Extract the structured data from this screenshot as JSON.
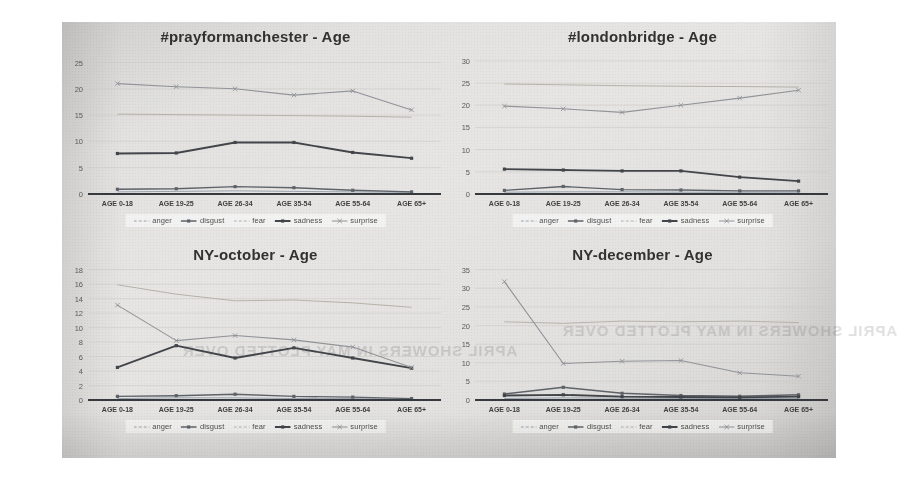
{
  "figure": {
    "categories": [
      "AGE 0-18",
      "AGE 19-25",
      "AGE 26-34",
      "AGE 35-54",
      "AGE 55-64",
      "AGE 65+"
    ],
    "legend": [
      {
        "name": "anger",
        "color": "#9aa4b0",
        "marker": "none",
        "width": 1
      },
      {
        "name": "disgust",
        "color": "#5a5f66",
        "marker": "dot",
        "width": 1.4
      },
      {
        "name": "fear",
        "color": "#b7b2a8",
        "marker": "none",
        "width": 1
      },
      {
        "name": "sadness",
        "color": "#3c3f44",
        "marker": "dot",
        "width": 1.8
      },
      {
        "name": "surprise",
        "color": "#8f9298",
        "marker": "x",
        "width": 1.1
      }
    ],
    "bleed_text": "APRIL SHOWERS IN MAY PLOTTED OVER"
  },
  "chart_data": [
    {
      "type": "line",
      "title": "#prayformanchester - Age",
      "xlabel": "",
      "ylabel": "",
      "categories": [
        "AGE 0-18",
        "AGE 19-25",
        "AGE 26-34",
        "AGE 35-54",
        "AGE 55-64",
        "AGE 65+"
      ],
      "yticks": [
        0,
        5,
        10,
        15,
        20,
        25
      ],
      "ylim": [
        0,
        27
      ],
      "grid": true,
      "legend_position": "bottom",
      "series": [
        {
          "name": "anger",
          "values": [
            0.4,
            0.5,
            0.6,
            0.5,
            0.4,
            0.3
          ]
        },
        {
          "name": "disgust",
          "values": [
            0.9,
            1.0,
            1.4,
            1.2,
            0.7,
            0.4
          ]
        },
        {
          "name": "fear",
          "values": [
            15.2,
            15.1,
            15.0,
            14.9,
            14.8,
            14.6
          ]
        },
        {
          "name": "sadness",
          "values": [
            7.7,
            7.8,
            9.8,
            9.8,
            7.9,
            6.8
          ]
        },
        {
          "name": "surprise",
          "values": [
            21.0,
            20.4,
            20.0,
            18.8,
            19.6,
            16.0
          ]
        }
      ]
    },
    {
      "type": "line",
      "title": "#londonbridge - Age",
      "xlabel": "",
      "ylabel": "",
      "categories": [
        "AGE 0-18",
        "AGE 19-25",
        "AGE 26-34",
        "AGE 35-54",
        "AGE 55-64",
        "AGE 65+"
      ],
      "yticks": [
        0,
        5,
        10,
        15,
        20,
        25,
        30
      ],
      "ylim": [
        0,
        32
      ],
      "grid": true,
      "legend_position": "bottom",
      "series": [
        {
          "name": "anger",
          "values": [
            0.4,
            0.5,
            0.5,
            0.4,
            0.4,
            0.4
          ]
        },
        {
          "name": "disgust",
          "values": [
            0.8,
            1.7,
            1.0,
            0.9,
            0.7,
            0.7
          ]
        },
        {
          "name": "fear",
          "values": [
            24.8,
            24.6,
            24.4,
            24.3,
            24.2,
            24.1
          ]
        },
        {
          "name": "sadness",
          "values": [
            5.6,
            5.4,
            5.2,
            5.2,
            3.8,
            2.9
          ]
        },
        {
          "name": "surprise",
          "values": [
            19.8,
            19.2,
            18.4,
            20.0,
            21.6,
            23.4
          ]
        }
      ]
    },
    {
      "type": "line",
      "title": "NY-october - Age",
      "xlabel": "",
      "ylabel": "",
      "categories": [
        "AGE 0-18",
        "AGE 19-25",
        "AGE 26-34",
        "AGE 35-54",
        "AGE 55-64",
        "AGE 65+"
      ],
      "yticks": [
        0,
        2,
        4,
        6,
        8,
        10,
        12,
        14,
        16,
        18
      ],
      "ylim": [
        0,
        18.5
      ],
      "grid": true,
      "legend_position": "bottom",
      "series": [
        {
          "name": "anger",
          "values": [
            0.2,
            0.3,
            0.3,
            0.2,
            0.2,
            0.1
          ]
        },
        {
          "name": "disgust",
          "values": [
            0.5,
            0.6,
            0.8,
            0.5,
            0.4,
            0.2
          ]
        },
        {
          "name": "fear",
          "values": [
            15.9,
            14.6,
            13.7,
            13.8,
            13.4,
            12.8
          ]
        },
        {
          "name": "sadness",
          "values": [
            4.5,
            7.5,
            5.8,
            7.2,
            5.8,
            4.4
          ]
        },
        {
          "name": "surprise",
          "values": [
            13.1,
            8.2,
            8.9,
            8.3,
            7.3,
            4.5
          ]
        }
      ]
    },
    {
      "type": "line",
      "title": "NY-december - Age",
      "xlabel": "",
      "ylabel": "",
      "categories": [
        "AGE 0-18",
        "AGE 19-25",
        "AGE 26-34",
        "AGE 35-54",
        "AGE 55-64",
        "AGE 65+"
      ],
      "yticks": [
        0,
        5,
        10,
        15,
        20,
        25,
        30,
        35
      ],
      "ylim": [
        0,
        36
      ],
      "grid": true,
      "legend_position": "bottom",
      "series": [
        {
          "name": "anger",
          "values": [
            0.4,
            0.6,
            0.5,
            0.4,
            0.4,
            0.4
          ]
        },
        {
          "name": "disgust",
          "values": [
            1.6,
            3.4,
            1.8,
            1.2,
            1.0,
            1.4
          ]
        },
        {
          "name": "fear",
          "values": [
            21.0,
            20.6,
            21.2,
            21.0,
            21.2,
            20.8
          ]
        },
        {
          "name": "sadness",
          "values": [
            1.2,
            1.4,
            0.9,
            0.8,
            0.7,
            0.9
          ]
        },
        {
          "name": "surprise",
          "values": [
            31.8,
            9.8,
            10.4,
            10.6,
            7.3,
            6.4
          ]
        }
      ]
    }
  ]
}
